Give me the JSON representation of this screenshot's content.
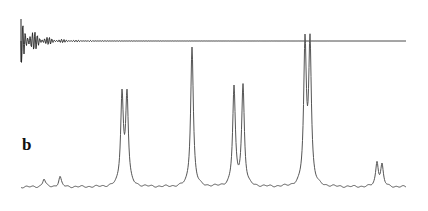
{
  "figure": {
    "panel_label": "b"
  },
  "chart_data": [
    {
      "type": "line",
      "title": "",
      "description": "Free induction decay (time-domain signal), top trace",
      "xlabel": "",
      "ylabel": "",
      "grid": false,
      "x_range_px": [
        21,
        406
      ],
      "baseline_px": 41,
      "envelope": "exponentially decaying oscillation, strong at left, flat by ~x=100px"
    },
    {
      "type": "line",
      "title": "",
      "description": "Frequency-domain NMR spectrum, bottom trace",
      "xlabel": "",
      "ylabel": "",
      "grid": false,
      "x_range_px": [
        21,
        406
      ],
      "baseline_px": 187,
      "peaks": [
        {
          "x": 44,
          "height": 8
        },
        {
          "x": 60,
          "height": 10
        },
        {
          "x": 122,
          "height": 90
        },
        {
          "x": 127,
          "height": 90
        },
        {
          "x": 192,
          "height": 140
        },
        {
          "x": 234,
          "height": 98
        },
        {
          "x": 243,
          "height": 100
        },
        {
          "x": 305,
          "height": 139
        },
        {
          "x": 310,
          "height": 141
        },
        {
          "x": 377,
          "height": 24
        },
        {
          "x": 382,
          "height": 21
        }
      ],
      "height_units": "pixels above baseline"
    }
  ],
  "colors": {
    "fid": "#222222",
    "spectrum": "#555555",
    "background": "#ffffff"
  }
}
